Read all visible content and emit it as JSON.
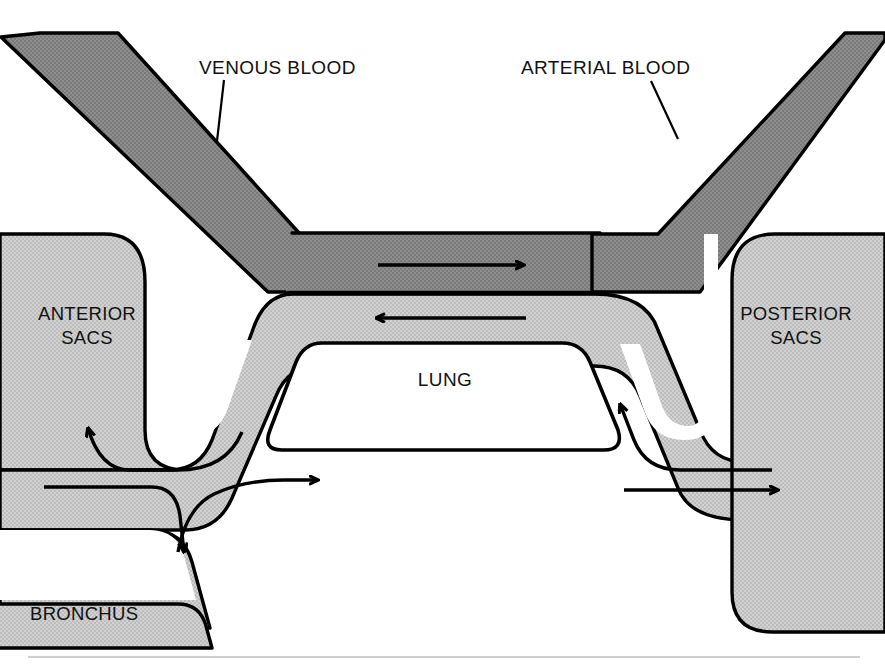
{
  "figure": {
    "width": 885,
    "height": 666,
    "background": "#ffffff"
  },
  "colors": {
    "dark_gray_blood": "#888888",
    "light_gray_airway": "#c9c9c9",
    "outline": "#000000",
    "white_lung": "#ffffff",
    "text": "#111111",
    "baseline_rule": "#b8b8b8"
  },
  "labels": {
    "venous_blood": "VENOUS BLOOD",
    "arterial_blood": "ARTERIAL BLOOD",
    "anterior_sacs_line1": "ANTERIOR",
    "anterior_sacs_line2": "SACS",
    "posterior_sacs_line1": "POSTERIOR",
    "posterior_sacs_line2": "SACS",
    "lung": "LUNG",
    "bronchus": "BRONCHUS"
  },
  "leader_lines": [
    {
      "name": "venous-blood-leader",
      "x1": 224,
      "y1": 79,
      "x2": 217,
      "y2": 141
    },
    {
      "name": "arterial-blood-leader",
      "x1": 651,
      "y1": 80,
      "x2": 678,
      "y2": 139
    }
  ],
  "flow_arrows": [
    {
      "name": "venous-capillary-flow-arrow",
      "direction": "right",
      "x1": 378,
      "y1": 265,
      "x2": 524,
      "y2": 265,
      "region": "venous-blood-vessel"
    },
    {
      "name": "airway-return-flow-arrow",
      "direction": "left",
      "x1": 526,
      "y1": 318,
      "x2": 372,
      "y2": 318,
      "region": "parabronchial-airway"
    },
    {
      "name": "anterior-sac-inflow-arrow",
      "direction": "upper-left",
      "x1": 196,
      "y1": 446,
      "x2": 84,
      "y2": 424,
      "region": "anterior-sacs"
    },
    {
      "name": "bronchus-inflow-arrow",
      "direction": "down",
      "x1": 181,
      "y1": 492,
      "x2": 156,
      "y2": 558,
      "region": "bronchus"
    },
    {
      "name": "mesobronchus-forward-arrow",
      "direction": "right",
      "x1": 44,
      "y1": 487,
      "x2": 161,
      "y2": 487,
      "region": "bronchus-trunk"
    },
    {
      "name": "parabronchus-forward-arrow",
      "direction": "right",
      "x1": 185,
      "y1": 478,
      "x2": 310,
      "y2": 478,
      "region": "lung-airway"
    },
    {
      "name": "posterior-sac-outflow-arrow",
      "direction": "right",
      "x1": 625,
      "y1": 490,
      "x2": 780,
      "y2": 490,
      "region": "posterior-sacs"
    },
    {
      "name": "posterior-sac-return-arrow",
      "direction": "upper-left",
      "x1": 770,
      "y1": 470,
      "x2": 632,
      "y2": 406,
      "region": "posterior-sacs-return"
    }
  ],
  "regions": [
    {
      "name": "venous-blood-vessel",
      "shade": "dark",
      "description": "Diagonal vessel entering from upper left, bending into horizontal capillary bed"
    },
    {
      "name": "arterial-blood-vessel",
      "shade": "dark",
      "description": "Diagonal vessel leaving to upper right from horizontal capillary bed"
    },
    {
      "name": "anterior-sacs",
      "shade": "light",
      "description": "Rounded block on the left"
    },
    {
      "name": "posterior-sacs",
      "shade": "light",
      "description": "Rounded block on the right"
    },
    {
      "name": "lung",
      "shade": "white",
      "description": "Central white trapezoid labelled LUNG"
    },
    {
      "name": "bronchus",
      "shade": "light",
      "description": "Lower-left airway trunk"
    }
  ]
}
